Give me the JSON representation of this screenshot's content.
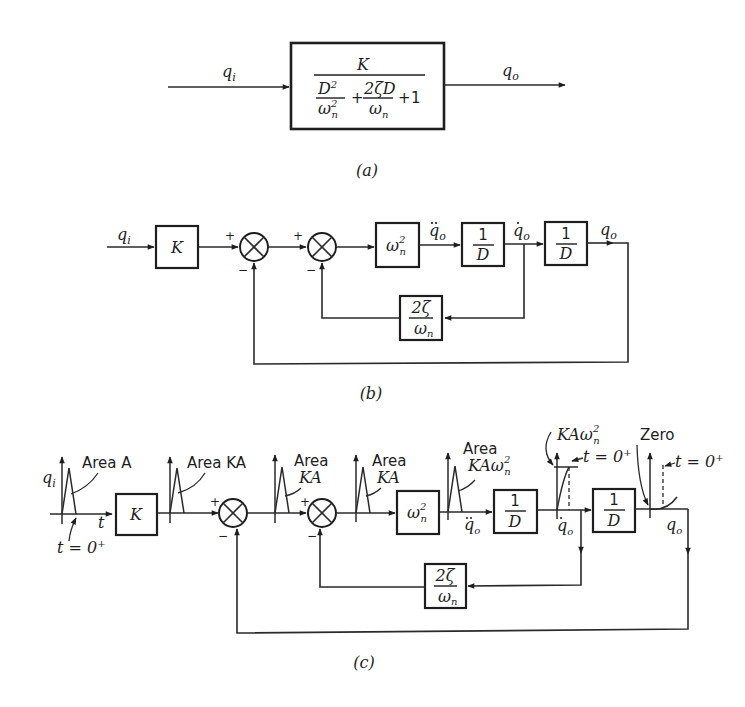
{
  "figure": {
    "panel_a": {
      "caption": "(a)",
      "input_label": "q",
      "input_sub": "i",
      "output_label": "q",
      "output_sub": "o",
      "block": {
        "numerator": "K",
        "den_term1_num": "D",
        "den_term1_num_sup": "2",
        "den_term1_den": "ω",
        "den_term1_den_sup": "2",
        "den_term1_den_sub": "n",
        "plus1": "+",
        "den_term2_num": "2ζD",
        "den_term2_den": "ω",
        "den_term2_den_sub": "n",
        "plus2": "+",
        "den_const": "1"
      }
    },
    "panel_b": {
      "caption": "(b)",
      "input_label": "q",
      "input_sub": "i",
      "gain_block": "K",
      "sum1_plus": "+",
      "sum1_minus": "−",
      "sum2_plus": "+",
      "sum2_minus": "−",
      "wn2_block": "ω",
      "wn2_sup": "2",
      "wn2_sub": "n",
      "qddot_label": "q",
      "qddot_sub": "o",
      "integrator1_num": "1",
      "integrator1_den": "D",
      "qdot_label": "q",
      "qdot_sub": "o",
      "integrator2_num": "1",
      "integrator2_den": "D",
      "output_label": "q",
      "output_sub": "o",
      "feedback_num": "2ζ",
      "feedback_den": "ω",
      "feedback_den_sub": "n"
    },
    "panel_c": {
      "caption": "(c)",
      "input_label": "q",
      "input_sub": "i",
      "area_a": "Area A",
      "t_axis": "t",
      "t0_label": "t = 0",
      "t0_sup": "+",
      "gain_block": "K",
      "area_ka_1": "Area KA",
      "sum1_plus": "+",
      "sum1_minus": "−",
      "area_ka_2_line1": "Area",
      "area_ka_2_line2": "KA",
      "sum2_plus": "+",
      "sum2_minus": "−",
      "area_ka_3_line1": "Area",
      "area_ka_3_line2": "KA",
      "wn2_block": "ω",
      "wn2_sup": "2",
      "wn2_sub": "n",
      "area_kawn2_line1": "Area",
      "area_kawn2_line2": "KAω",
      "area_kawn2_sup": "2",
      "area_kawn2_sub": "n",
      "qddot_label": "q",
      "qddot_sub": "o",
      "integrator1_num": "1",
      "integrator1_den": "D",
      "step_height_label": "KAω",
      "step_height_sup": "2",
      "step_height_sub": "n",
      "t0_label_2": "t = 0",
      "t0_sup_2": "+",
      "qdot_label": "q",
      "qdot_sub": "o",
      "integrator2_num": "1",
      "integrator2_den": "D",
      "zero_label": "Zero",
      "t0_label_3": "t = 0",
      "t0_sup_3": "+",
      "output_label": "q",
      "output_sub": "o",
      "feedback_num": "2ζ",
      "feedback_den": "ω",
      "feedback_den_sub": "n"
    }
  }
}
